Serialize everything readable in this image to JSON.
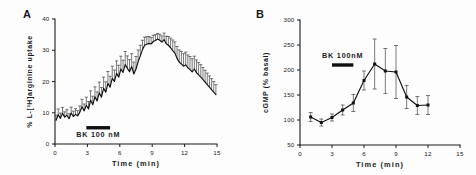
{
  "figure": {
    "background": "#fdfdfd",
    "ink_color": "#111111"
  },
  "panels": [
    {
      "letter": "A",
      "treatment_label": "BK  100 nM"
    },
    {
      "letter": "B",
      "treatment_label": "BK  100nM"
    }
  ],
  "chart_data": [
    {
      "type": "line",
      "panel": "A",
      "title": "",
      "xlabel": "Time  (min)",
      "ylabel": "% L-[3H]arginine uptake",
      "ylabel_display": "% L-[³H]arginine uptake",
      "xlim": [
        0,
        15
      ],
      "ylim": [
        0,
        40
      ],
      "xticks": [
        0,
        3,
        6,
        9,
        12,
        15
      ],
      "yticks": [
        0,
        10,
        20,
        30,
        40
      ],
      "grid": false,
      "legend": "none",
      "annotation": {
        "text": "BK  100 nM",
        "bar_x_start": 2.9,
        "bar_x_end": 5.1,
        "bar_y": 5.2,
        "text_y": 3.0
      },
      "series": [
        {
          "name": "L-[3H]arginine uptake",
          "x": [
            0.1,
            0.3,
            0.5,
            0.7,
            0.9,
            1.1,
            1.3,
            1.5,
            1.7,
            1.9,
            2.1,
            2.3,
            2.5,
            2.7,
            2.9,
            3.1,
            3.3,
            3.5,
            3.7,
            3.9,
            4.1,
            4.3,
            4.5,
            4.7,
            4.9,
            5.1,
            5.3,
            5.5,
            5.7,
            5.9,
            6.1,
            6.3,
            6.5,
            6.7,
            6.9,
            7.1,
            7.3,
            7.5,
            7.7,
            7.9,
            8.1,
            8.3,
            8.5,
            8.7,
            8.9,
            9.1,
            9.3,
            9.5,
            9.7,
            9.9,
            10.1,
            10.3,
            10.5,
            10.7,
            10.9,
            11.1,
            11.3,
            11.5,
            11.7,
            11.9,
            12.1,
            12.3,
            12.5,
            12.7,
            12.9,
            13.1,
            13.3,
            13.5,
            13.7,
            13.9,
            14.1,
            14.3,
            14.5,
            14.7,
            14.9
          ],
          "y": [
            7.6,
            9.4,
            8.2,
            9.8,
            8.6,
            9.2,
            8.1,
            9.9,
            8.8,
            9.5,
            9.0,
            10.2,
            11.9,
            10.6,
            12.4,
            11.2,
            14.0,
            12.6,
            15.1,
            13.8,
            16.4,
            15.0,
            17.8,
            16.6,
            19.4,
            18.2,
            21.0,
            20.0,
            22.6,
            21.4,
            24.0,
            22.9,
            25.4,
            24.2,
            23.1,
            24.8,
            22.4,
            24.0,
            26.4,
            28.2,
            30.2,
            31.6,
            31.9,
            32.2,
            32.0,
            32.8,
            33.1,
            33.6,
            33.2,
            32.6,
            33.4,
            32.1,
            31.6,
            30.8,
            29.9,
            29.1,
            27.4,
            26.2,
            25.6,
            24.9,
            25.3,
            24.4,
            23.8,
            23.1,
            24.0,
            22.8,
            22.1,
            21.4,
            20.6,
            19.8,
            19.0,
            18.2,
            17.4,
            16.6,
            15.8
          ],
          "errors": [
            1.6,
            1.8,
            1.7,
            1.9,
            1.7,
            1.8,
            1.6,
            1.9,
            1.7,
            1.8,
            1.7,
            2.0,
            2.4,
            2.2,
            2.6,
            2.4,
            3.0,
            2.7,
            3.2,
            2.9,
            3.4,
            3.1,
            3.6,
            3.3,
            3.8,
            3.5,
            3.9,
            3.7,
            4.0,
            3.8,
            4.1,
            3.9,
            4.2,
            4.0,
            3.9,
            4.1,
            3.8,
            4.0,
            3.7,
            3.4,
            3.0,
            2.6,
            2.4,
            2.2,
            2.1,
            2.0,
            1.9,
            1.8,
            1.9,
            2.0,
            2.1,
            2.4,
            2.8,
            3.1,
            3.4,
            3.6,
            3.8,
            3.9,
            4.0,
            4.0,
            4.1,
            4.1,
            4.2,
            4.2,
            4.1,
            4.1,
            4.0,
            4.0,
            3.9,
            3.8,
            3.7,
            3.6,
            3.5,
            3.4,
            3.2
          ]
        }
      ]
    },
    {
      "type": "line",
      "panel": "B",
      "title": "",
      "xlabel": "Time  (min)",
      "ylabel": "cGMP (% basal)",
      "ylabel_display": "cGMP (% basal)",
      "xlim": [
        0,
        15
      ],
      "ylim": [
        50,
        300
      ],
      "xticks": [
        0,
        3,
        6,
        9,
        12,
        15
      ],
      "yticks": [
        50,
        100,
        150,
        200,
        250,
        300
      ],
      "grid": false,
      "legend": "none",
      "markers": "filled-square",
      "annotation": {
        "text": "BK  100nM",
        "bar_x_start": 3.0,
        "bar_x_end": 5.0,
        "bar_y": 210,
        "text_y": 228
      },
      "series": [
        {
          "name": "cGMP",
          "x": [
            1,
            2,
            3,
            4,
            5,
            6,
            7,
            8,
            9,
            10,
            11,
            12
          ],
          "y": [
            106,
            95,
            105,
            120,
            134,
            179,
            212,
            198,
            196,
            146,
            129,
            130
          ],
          "errors": [
            9,
            7,
            7,
            10,
            17,
            19,
            50,
            45,
            53,
            23,
            18,
            19
          ]
        }
      ]
    }
  ]
}
